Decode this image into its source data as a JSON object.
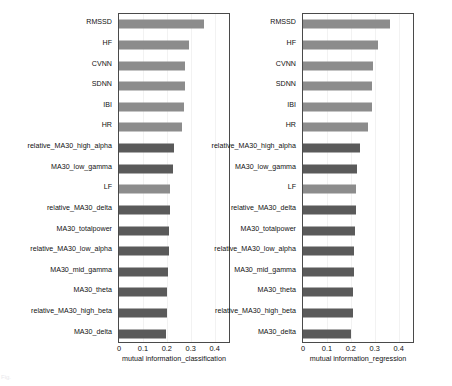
{
  "figure": {
    "caption_fragment": "Fig.",
    "bar_colors": {
      "hrv": "#8c8c8c",
      "eeg": "#5a5a5a"
    },
    "frame_color": "#4a4a4a",
    "grid": true,
    "legend": "none"
  },
  "chart_data": [
    {
      "type": "bar",
      "orientation": "horizontal",
      "title": "",
      "xlabel": "mutual information_classification",
      "ylabel": "",
      "xlim": [
        0,
        0.46
      ],
      "xticks": [
        "0",
        "0.1",
        "0.2",
        "0.3",
        "0.4"
      ],
      "xtick_values": [
        0,
        0.1,
        0.2,
        0.3,
        0.4
      ],
      "categories": [
        "RMSSD",
        "HF",
        "CVNN",
        "SDNN",
        "IBI",
        "HR",
        "relative_MA30_high_alpha",
        "MA30_low_gamma",
        "LF",
        "relative_MA30_delta",
        "MA30_totalpower",
        "relative_MA30_low_alpha",
        "MA30_mid_gamma",
        "MA30_theta",
        "relative_MA30_high_beta",
        "MA30_delta"
      ],
      "values": [
        0.355,
        0.293,
        0.277,
        0.277,
        0.27,
        0.262,
        0.232,
        0.225,
        0.215,
        0.215,
        0.21,
        0.21,
        0.205,
        0.2,
        0.2,
        0.195
      ],
      "group": [
        "hrv",
        "hrv",
        "hrv",
        "hrv",
        "hrv",
        "hrv",
        "eeg",
        "eeg",
        "hrv",
        "eeg",
        "eeg",
        "eeg",
        "eeg",
        "eeg",
        "eeg",
        "eeg"
      ]
    },
    {
      "type": "bar",
      "orientation": "horizontal",
      "title": "",
      "xlabel": "mutual information_regression",
      "ylabel": "",
      "xlim": [
        0,
        0.46
      ],
      "xticks": [
        "0",
        "0.1",
        "0.2",
        "0.3",
        "0.4"
      ],
      "xtick_values": [
        0,
        0.1,
        0.2,
        0.3,
        0.4
      ],
      "categories": [
        "RMSSD",
        "HF",
        "CVNN",
        "SDNN",
        "IBI",
        "HR",
        "relative_MA30_high_alpha",
        "MA30_low_gamma",
        "LF",
        "relative_MA30_delta",
        "MA30_totalpower",
        "relative_MA30_low_alpha",
        "MA30_mid_gamma",
        "MA30_theta",
        "relative_MA30_high_beta",
        "MA30_delta"
      ],
      "values": [
        0.365,
        0.315,
        0.292,
        0.29,
        0.288,
        0.27,
        0.237,
        0.225,
        0.222,
        0.22,
        0.218,
        0.215,
        0.212,
        0.208,
        0.208,
        0.202
      ],
      "group": [
        "hrv",
        "hrv",
        "hrv",
        "hrv",
        "hrv",
        "hrv",
        "eeg",
        "eeg",
        "hrv",
        "eeg",
        "eeg",
        "eeg",
        "eeg",
        "eeg",
        "eeg",
        "eeg"
      ]
    }
  ]
}
